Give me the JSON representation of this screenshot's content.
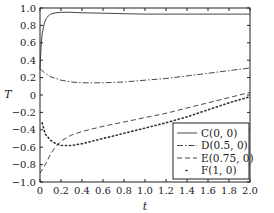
{
  "chart_data": {
    "type": "line",
    "title": "",
    "xlabel": "t",
    "ylabel": "T",
    "xlim": [
      0,
      2.0
    ],
    "ylim": [
      -1.0,
      1.0
    ],
    "xticks": [
      "0",
      "0.2",
      "0.4",
      "0.6",
      "0.8",
      "1.0",
      "1.2",
      "1.4",
      "1.6",
      "1.8",
      "2.0"
    ],
    "yticks": [
      "1.0",
      "0.8",
      "0.6",
      "0.4",
      "0.2",
      "0",
      "−0.2",
      "−0.4",
      "−0.6",
      "−0.8",
      "−1.0"
    ],
    "grid": false,
    "legend_position": "lower right",
    "series": [
      {
        "name": "C(0, 0)",
        "style": "solid",
        "x": [
          0.0,
          0.01,
          0.02,
          0.04,
          0.06,
          0.08,
          0.1,
          0.15,
          0.2,
          0.3,
          0.4,
          0.6,
          0.8,
          1.0,
          1.5,
          2.0
        ],
        "y": [
          0.3,
          0.55,
          0.7,
          0.82,
          0.88,
          0.91,
          0.93,
          0.945,
          0.95,
          0.95,
          0.945,
          0.94,
          0.935,
          0.93,
          0.93,
          0.93
        ]
      },
      {
        "name": "D(0.5, 0)",
        "style": "dashdot",
        "x": [
          0.0,
          0.05,
          0.1,
          0.2,
          0.3,
          0.4,
          0.5,
          0.6,
          0.8,
          1.0,
          1.2,
          1.4,
          1.6,
          1.8,
          2.0
        ],
        "y": [
          0.3,
          0.25,
          0.21,
          0.17,
          0.15,
          0.14,
          0.14,
          0.14,
          0.15,
          0.17,
          0.19,
          0.22,
          0.25,
          0.28,
          0.31
        ]
      },
      {
        "name": "E(0.75, 0)",
        "style": "dashed",
        "x": [
          0.0,
          0.05,
          0.1,
          0.15,
          0.2,
          0.3,
          0.4,
          0.6,
          0.8,
          1.0,
          1.2,
          1.4,
          1.6,
          1.8,
          2.0
        ],
        "y": [
          -0.9,
          -0.8,
          -0.68,
          -0.59,
          -0.53,
          -0.46,
          -0.42,
          -0.36,
          -0.31,
          -0.26,
          -0.21,
          -0.15,
          -0.09,
          -0.03,
          0.03
        ]
      },
      {
        "name": "F(1, 0)",
        "style": "dotted",
        "x": [
          0.02,
          0.05,
          0.1,
          0.15,
          0.2,
          0.25,
          0.3,
          0.4,
          0.5,
          0.6,
          0.8,
          1.0,
          1.2,
          1.4,
          1.6,
          1.8,
          2.0
        ],
        "y": [
          -0.32,
          -0.45,
          -0.52,
          -0.56,
          -0.58,
          -0.58,
          -0.58,
          -0.56,
          -0.53,
          -0.5,
          -0.44,
          -0.38,
          -0.32,
          -0.25,
          -0.17,
          -0.09,
          -0.02
        ]
      }
    ]
  },
  "legend": {
    "items": [
      {
        "label": "C(0, 0)",
        "style": "solid"
      },
      {
        "label": "D(0.5, 0)",
        "style": "dashdot"
      },
      {
        "label": "E(0.75, 0)",
        "style": "dashed"
      },
      {
        "label": "F(1, 0)",
        "style": "dotted"
      }
    ]
  },
  "colors": {
    "line": "#333333",
    "axis": "#222222",
    "background": "#ffffff"
  }
}
